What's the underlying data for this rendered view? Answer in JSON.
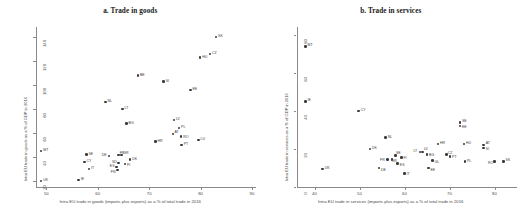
{
  "figure": {
    "panels": [
      {
        "key": "goods",
        "title": "a. Trade in goods",
        "xlabel": "Intra EU trade in goods (imports plus exports) as a % of total trade in 2016",
        "ylabel": "Intra EU trade in goods as a % of GDP in 2016",
        "xticks": [
          "50",
          "60",
          "70",
          "80",
          "90"
        ],
        "yticks": [
          "140",
          "120",
          "100",
          "80",
          "60",
          "40",
          "20"
        ]
      },
      {
        "key": "services",
        "title": "b. Trade in services",
        "xlabel": "Intra EU trade in services (imports plus exports) as a % of total trade in 2016",
        "ylabel": "Intra EU trade in services as a % of GDP in 2016",
        "xticks": [
          "40",
          "50",
          "60",
          "70",
          "80"
        ],
        "yticks": [
          "80",
          "60",
          "40",
          "20",
          "0"
        ]
      }
    ]
  },
  "chart_data": [
    {
      "type": "scatter",
      "title": "a. Trade in goods",
      "xlabel": "Intra EU trade in goods (imports plus exports) as a % of total trade in 2016",
      "ylabel": "Intra EU trade in goods as a % of GDP in 2016",
      "xlim": [
        48,
        90
      ],
      "ylim": [
        15,
        145
      ],
      "xticks": [
        50,
        60,
        70,
        80,
        90
      ],
      "yticks": [
        20,
        40,
        60,
        80,
        100,
        120,
        140
      ],
      "grid": false,
      "legend": "none",
      "points": [
        {
          "label": "SK",
          "x": 83.0,
          "y": 140.0
        },
        {
          "label": "CZ",
          "x": 81.8,
          "y": 126.0
        },
        {
          "label": "HU",
          "x": 79.9,
          "y": 123.0
        },
        {
          "label": "BE",
          "x": 67.8,
          "y": 108.0
        },
        {
          "label": "SI",
          "x": 72.8,
          "y": 103.0
        },
        {
          "label": "EE",
          "x": 78.0,
          "y": 96.0
        },
        {
          "label": "NL",
          "x": 61.5,
          "y": 86.0
        },
        {
          "label": "LT",
          "x": 64.8,
          "y": 80.0
        },
        {
          "label": "LV",
          "x": 74.8,
          "y": 71.0
        },
        {
          "label": "BG",
          "x": 65.6,
          "y": 68.0
        },
        {
          "label": "PL",
          "x": 75.8,
          "y": 64.0
        },
        {
          "label": "AT",
          "x": 74.6,
          "y": 59.0
        },
        {
          "label": "RO",
          "x": 76.2,
          "y": 57.0
        },
        {
          "label": "LU",
          "x": 79.6,
          "y": 54.0
        },
        {
          "label": "HR",
          "x": 71.2,
          "y": 53.0
        },
        {
          "label": "PT",
          "x": 76.3,
          "y": 50.0
        },
        {
          "label": "MT",
          "x": 49.0,
          "y": 45.0
        },
        {
          "label": "SE",
          "x": 57.8,
          "y": 42.0
        },
        {
          "label": "FR",
          "x": 64.0,
          "y": 41.5
        },
        {
          "label": "GR",
          "x": 64.6,
          "y": 41.5
        },
        {
          "label": "DE",
          "x": 62.2,
          "y": 41.0
        },
        {
          "label": "DK",
          "x": 66.3,
          "y": 38.0
        },
        {
          "label": "CY",
          "x": 57.4,
          "y": 36.0
        },
        {
          "label": "SD",
          "x": 64.0,
          "y": 35.0
        },
        {
          "label": "FI",
          "x": 65.3,
          "y": 34.0
        },
        {
          "label": "ES",
          "x": 63.6,
          "y": 31.5
        },
        {
          "label": "IT",
          "x": 58.3,
          "y": 30.0
        },
        {
          "label": "FN",
          "x": 63.8,
          "y": 29.0
        },
        {
          "label": "IE",
          "x": 56.3,
          "y": 21.0
        },
        {
          "label": "UK",
          "x": 49.0,
          "y": 20.0
        }
      ]
    },
    {
      "type": "scatter",
      "title": "b. Trade in services",
      "xlabel": "Intra EU trade in services (imports plus exports) as a % of total trade in 2016",
      "ylabel": "Intra EU trade in services as a % of GDP in 2016",
      "xlim": [
        36,
        84
      ],
      "ylim": [
        0,
        82
      ],
      "xticks": [
        40,
        50,
        60,
        70,
        80
      ],
      "yticks": [
        0,
        20,
        40,
        60,
        80
      ],
      "grid": false,
      "legend": "none",
      "points": [
        {
          "label": "MT",
          "x": 38.0,
          "y": 74.0
        },
        {
          "label": "IE",
          "x": 38.0,
          "y": 45.0
        },
        {
          "label": "CY",
          "x": 49.8,
          "y": 40.0
        },
        {
          "label": "SE",
          "x": 72.3,
          "y": 34.0
        },
        {
          "label": "EE",
          "x": 72.3,
          "y": 32.0
        },
        {
          "label": "NL",
          "x": 55.8,
          "y": 26.0
        },
        {
          "label": "HR",
          "x": 67.4,
          "y": 22.5
        },
        {
          "label": "HU",
          "x": 73.2,
          "y": 22.5
        },
        {
          "label": "AT",
          "x": 77.6,
          "y": 22.0
        },
        {
          "label": "SI",
          "x": 77.6,
          "y": 20.5
        },
        {
          "label": "DK",
          "x": 52.3,
          "y": 20.0
        },
        {
          "label": "LT",
          "x": 63.4,
          "y": 18.5
        },
        {
          "label": "LV",
          "x": 64.0,
          "y": 18.5
        },
        {
          "label": "BG",
          "x": 65.0,
          "y": 17.0
        },
        {
          "label": "CZ",
          "x": 69.3,
          "y": 17.0
        },
        {
          "label": "SE2",
          "x": 58.0,
          "y": 16.5
        },
        {
          "label": "PT",
          "x": 70.1,
          "y": 16.0
        },
        {
          "label": "FI",
          "x": 59.3,
          "y": 15.5
        },
        {
          "label": "FR",
          "x": 56.2,
          "y": 14.5
        },
        {
          "label": "GR",
          "x": 57.2,
          "y": 14.5
        },
        {
          "label": "GL",
          "x": 66.2,
          "y": 14.0
        },
        {
          "label": "PL",
          "x": 73.4,
          "y": 13.5
        },
        {
          "label": "RO",
          "x": 80.0,
          "y": 13.5
        },
        {
          "label": "SK",
          "x": 82.0,
          "y": 13.5
        },
        {
          "label": "ES",
          "x": 58.5,
          "y": 12.5
        },
        {
          "label": "DE",
          "x": 54.3,
          "y": 10.0
        },
        {
          "label": "EE2",
          "x": 65.3,
          "y": 10.0
        },
        {
          "label": "UK",
          "x": 41.8,
          "y": 9.5
        },
        {
          "label": "IT",
          "x": 60.0,
          "y": 7.0
        }
      ]
    }
  ]
}
